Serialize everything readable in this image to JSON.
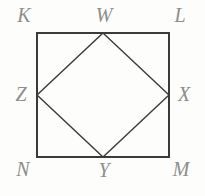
{
  "figure": {
    "background_color": "#fdfdfb",
    "outer_square": {
      "name": "KLMN",
      "stroke_color": "#3b3b3b",
      "stroke_width": 2,
      "fill": "none",
      "vertices": [
        {
          "label": "K",
          "x": 37,
          "y": 33,
          "position": "top-left"
        },
        {
          "label": "L",
          "x": 169,
          "y": 33,
          "position": "top-right"
        },
        {
          "label": "M",
          "x": 169,
          "y": 157,
          "position": "bottom-right"
        },
        {
          "label": "N",
          "x": 37,
          "y": 157,
          "position": "bottom-left"
        }
      ]
    },
    "inner_square": {
      "name": "WXYZ",
      "stroke_color": "#3b3b3b",
      "stroke_width": 1.4,
      "fill": "none",
      "vertices": [
        {
          "label": "W",
          "x": 103,
          "y": 33,
          "position": "top-midpoint"
        },
        {
          "label": "X",
          "x": 169,
          "y": 95,
          "position": "right-midpoint"
        },
        {
          "label": "Y",
          "x": 103,
          "y": 157,
          "position": "bottom-midpoint"
        },
        {
          "label": "Z",
          "x": 37,
          "y": 95,
          "position": "left-midpoint"
        }
      ]
    },
    "labels": {
      "K": "K",
      "L": "L",
      "M": "M",
      "N": "N",
      "W": "W",
      "X": "X",
      "Y": "Y",
      "Z": "Z"
    },
    "label_color": "#8d8d8d"
  }
}
